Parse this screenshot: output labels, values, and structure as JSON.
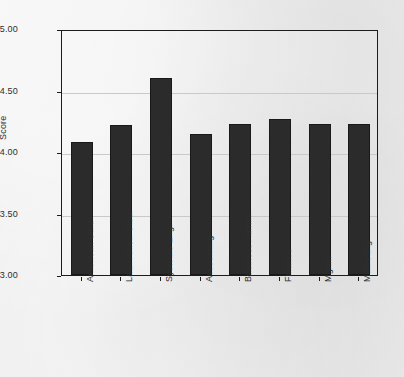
{
  "chart_data": {
    "type": "bar",
    "title": "",
    "subtitle": "",
    "xlabel": "",
    "ylabel": "Score",
    "ylim": [
      3.0,
      5.0
    ],
    "grid": true,
    "legend": "none",
    "yticks": [
      "5.00",
      "4.50",
      "4.00",
      "3.50",
      "3.00"
    ],
    "ytick_values": [
      5.0,
      4.5,
      4.0,
      3.5,
      3.0
    ],
    "categories": [
      "American Stud.",
      "Latin Amer. Stud.",
      "Systems Eng.",
      "Accounting",
      "Business Admin.",
      "Finance",
      "Mgmt.",
      "Marketing"
    ],
    "values": [
      4.08,
      4.22,
      4.6,
      4.15,
      4.23,
      4.27,
      4.23,
      4.23
    ],
    "bar_color": "#2b2b2b",
    "background_color": "#ececec",
    "axis_color": "#1c1c1c",
    "grid_color": "#c9c9c9"
  }
}
